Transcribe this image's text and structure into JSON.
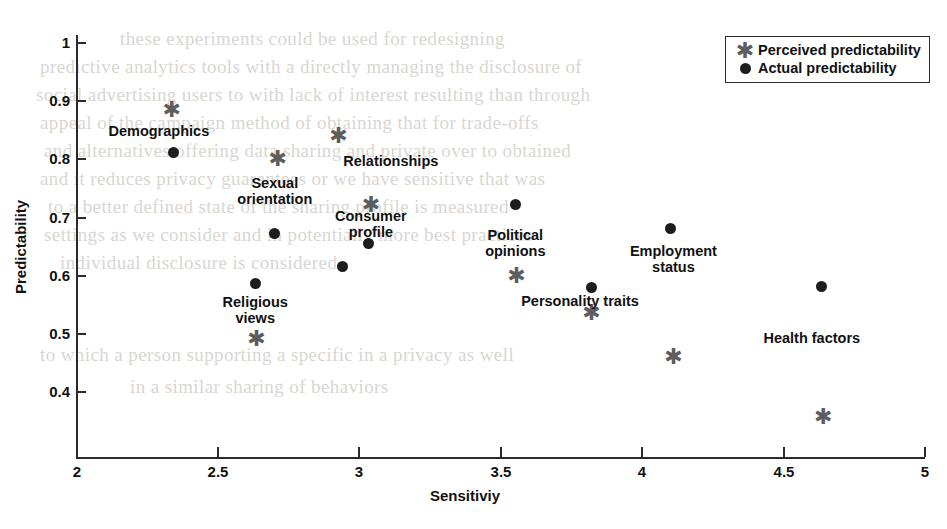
{
  "chart_data": {
    "type": "scatter",
    "title": "",
    "xlabel": "Sensitiviy",
    "ylabel": "Predictability",
    "xlim": [
      2,
      5
    ],
    "ylim": [
      0.33,
      1
    ],
    "xticks": [
      "2",
      "2.5",
      "3",
      "3.5",
      "4",
      "4.5",
      "5"
    ],
    "xtick_values": [
      2,
      2.5,
      3,
      3.5,
      4,
      4.5,
      5
    ],
    "yticks": [
      "1",
      "0.9",
      "0.8",
      "0.7",
      "0.6",
      "0.5",
      "0.4"
    ],
    "ytick_values": [
      1,
      0.9,
      0.8,
      0.7,
      0.6,
      0.5,
      0.4
    ],
    "grid": false,
    "legend_position": "top-right",
    "series": [
      {
        "name": "Perceived predictability",
        "marker": "star",
        "color": "#5d5d5d",
        "points": [
          {
            "label": "Demographics",
            "x": 2.335,
            "y": 0.885
          },
          {
            "label": "Religious views",
            "x": 2.635,
            "y": 0.49
          },
          {
            "label": "Sexual orientation",
            "x": 2.71,
            "y": 0.8
          },
          {
            "label": "Relationships",
            "x": 2.925,
            "y": 0.84
          },
          {
            "label": "Consumer profile",
            "x": 3.04,
            "y": 0.72
          },
          {
            "label": "Political opinions",
            "x": 3.555,
            "y": 0.598
          },
          {
            "label": "Personality traits",
            "x": 3.82,
            "y": 0.535
          },
          {
            "label": "Employment status",
            "x": 4.11,
            "y": 0.458
          },
          {
            "label": "Health factors",
            "x": 4.64,
            "y": 0.356
          }
        ]
      },
      {
        "name": "Actual predictability",
        "marker": "dot",
        "color": "#1d1d1d",
        "points": [
          {
            "label": "Demographics",
            "x": 2.34,
            "y": 0.811
          },
          {
            "label": "Religious views",
            "x": 2.63,
            "y": 0.585
          },
          {
            "label": "Sexual orientation",
            "x": 2.7,
            "y": 0.672
          },
          {
            "label": "Relationships",
            "x": 2.94,
            "y": 0.614
          },
          {
            "label": "Consumer profile",
            "x": 3.03,
            "y": 0.654
          },
          {
            "label": "Political opinions",
            "x": 3.55,
            "y": 0.721
          },
          {
            "label": "Personality traits",
            "x": 3.82,
            "y": 0.578
          },
          {
            "label": "Employment status",
            "x": 4.1,
            "y": 0.681
          },
          {
            "label": "Health factors",
            "x": 4.635,
            "y": 0.581
          }
        ]
      }
    ],
    "annotations": [
      {
        "text": "Demographics",
        "x": 2.29,
        "y": 0.848,
        "lines": [
          "Demographics"
        ]
      },
      {
        "text": "Relationships",
        "x": 3.11,
        "y": 0.797,
        "lines": [
          "Relationships"
        ]
      },
      {
        "text": "Sexual orientation",
        "x": 2.7,
        "y": 0.745,
        "lines": [
          "Sexual",
          "orientation"
        ]
      },
      {
        "text": "Consumer profile",
        "x": 3.04,
        "y": 0.688,
        "lines": [
          "Consumer",
          "profile"
        ]
      },
      {
        "text": "Religious views",
        "x": 2.63,
        "y": 0.54,
        "lines": [
          "Religious",
          "views"
        ]
      },
      {
        "text": "Political opinions",
        "x": 3.55,
        "y": 0.655,
        "lines": [
          "Political",
          "opinions"
        ]
      },
      {
        "text": "Personality traits",
        "x": 3.78,
        "y": 0.556,
        "lines": [
          "Personality traits"
        ]
      },
      {
        "text": "Employment status",
        "x": 4.11,
        "y": 0.628,
        "lines": [
          "Employment",
          "status"
        ]
      },
      {
        "text": "Health factors",
        "x": 4.6,
        "y": 0.492,
        "lines": [
          "Health factors"
        ]
      }
    ],
    "legend": [
      {
        "label": "Perceived predictability",
        "marker": "star"
      },
      {
        "label": "Actual predictability",
        "marker": "dot"
      }
    ]
  },
  "marker_glyphs": {
    "star": "✱"
  },
  "background_text": {
    "lines": [
      {
        "text": "these  experiments  could  be  used  for  redesigning",
        "x": 120,
        "y": 24
      },
      {
        "text": "predictive  analytics  tools  with  a  directly  managing  the  disclosure  of",
        "x": 40,
        "y": 52
      },
      {
        "text": "social  advertising  users  to  with  lack  of  interest   resulting   than   through",
        "x": 36,
        "y": 80
      },
      {
        "text": "appeal  of  the  campaign   method  of   obtaining   that   for   trade-offs",
        "x": 40,
        "y": 108
      },
      {
        "text": "and   alternatives  offering  data  sharing  and  private  over  to  obtained",
        "x": 44,
        "y": 136
      },
      {
        "text": "and  it  reduces  privacy  guarantees  or  we  have   sensitive   that   was",
        "x": 40,
        "y": 164
      },
      {
        "text": "to  a  better  defined  state  of  the  sharing  profile  is  measured",
        "x": 48,
        "y": 192
      },
      {
        "text": "settings  as  we  consider  and  in  potentially  more  best  practices",
        "x": 44,
        "y": 220
      },
      {
        "text": "individual  disclosure  is  considered",
        "x": 60,
        "y": 248
      },
      {
        "text": "to  which  a  person  supporting  a  specific  in  a  privacy   as  well",
        "x": 40,
        "y": 340
      },
      {
        "text": "in  a  similar  sharing  of  behaviors",
        "x": 130,
        "y": 372
      }
    ]
  }
}
